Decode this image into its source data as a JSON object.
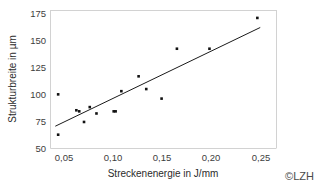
{
  "chart_data": {
    "type": "scatter",
    "title": "",
    "xlabel": "Streckenenergie in J/mm",
    "ylabel": "Strukturbreite in µm",
    "xlim": [
      0.032,
      0.268
    ],
    "ylim": [
      50,
      180
    ],
    "xticks": [
      0.05,
      0.1,
      0.15,
      0.2,
      0.25
    ],
    "xticklabels": [
      "0,05",
      "0,10",
      "0,15",
      "0,20",
      "0,25"
    ],
    "yticks": [
      50,
      75,
      100,
      125,
      150,
      175
    ],
    "yticklabels": [
      "50",
      "75",
      "100",
      "125",
      "150",
      "175"
    ],
    "grid": false,
    "legend": false,
    "series": [
      {
        "name": "Messpunkte",
        "marker": "square",
        "color": "#121212",
        "points": [
          {
            "x": 0.04,
            "y": 101
          },
          {
            "x": 0.04,
            "y": 63
          },
          {
            "x": 0.059,
            "y": 86
          },
          {
            "x": 0.062,
            "y": 85
          },
          {
            "x": 0.067,
            "y": 75
          },
          {
            "x": 0.073,
            "y": 89
          },
          {
            "x": 0.08,
            "y": 83
          },
          {
            "x": 0.098,
            "y": 85
          },
          {
            "x": 0.1,
            "y": 85
          },
          {
            "x": 0.106,
            "y": 104
          },
          {
            "x": 0.124,
            "y": 118
          },
          {
            "x": 0.132,
            "y": 106
          },
          {
            "x": 0.148,
            "y": 97
          },
          {
            "x": 0.164,
            "y": 144
          },
          {
            "x": 0.198,
            "y": 144
          },
          {
            "x": 0.248,
            "y": 173
          }
        ]
      }
    ],
    "trendline": {
      "name": "Linearer Trend",
      "color": "#1a1a1a",
      "x_start": 0.037,
      "y_start": 71,
      "x_end": 0.251,
      "y_end": 164
    }
  },
  "figure": {
    "copyright": "©LZH",
    "background_color": "#ffffff",
    "axis_color": "#d2d2d2"
  }
}
